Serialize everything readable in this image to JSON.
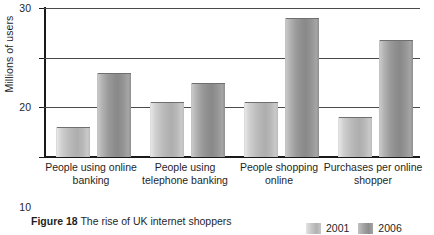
{
  "figure": {
    "caption_prefix": "Figure 18",
    "caption_text": "The rise of UK internet shoppers"
  },
  "axis": {
    "ylabel": "Millions of users",
    "yticks": [
      "0",
      "10",
      "20",
      "30"
    ]
  },
  "legend": {
    "items": [
      {
        "label": "2001",
        "color": "#b8b8b8"
      },
      {
        "label": "2006",
        "color": "#949494"
      }
    ]
  },
  "chart_data": {
    "type": "bar",
    "title": "The rise of UK internet shoppers",
    "xlabel": "",
    "ylabel": "Millions of users",
    "ylim": [
      0,
      30
    ],
    "yticks": [
      0,
      10,
      20,
      30
    ],
    "grid": true,
    "legend_position": "bottom-right",
    "categories": [
      "People using online banking",
      "People using telephone banking",
      "People shopping online",
      "Purchases per online shopper"
    ],
    "series": [
      {
        "name": "2001",
        "color": "#b8b8b8",
        "values": [
          6,
          11,
          11,
          8
        ]
      },
      {
        "name": "2006",
        "color": "#949494",
        "values": [
          17,
          15,
          28,
          23.5
        ]
      }
    ]
  }
}
